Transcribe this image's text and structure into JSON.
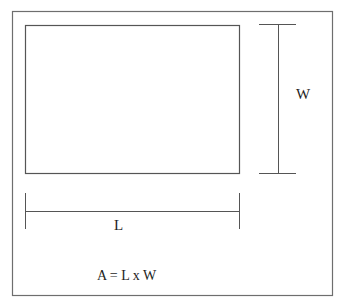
{
  "diagram": {
    "type": "rectangle-area",
    "labels": {
      "width": "W",
      "length": "L",
      "formula": "A = L x W"
    },
    "colors": {
      "frame": "#6e6e6e",
      "rectangle": "#555555",
      "dimension_lines": "#555555",
      "text": "#1e1e1e",
      "background": "#ffffff"
    }
  }
}
